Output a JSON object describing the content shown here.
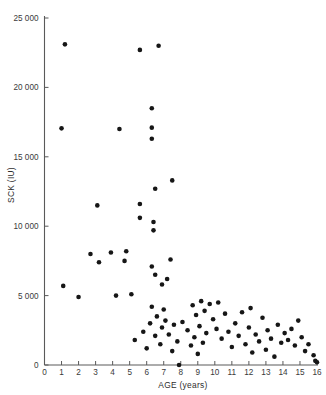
{
  "chart_data": {
    "type": "scatter",
    "title": "",
    "xlabel": "AGE (years)",
    "ylabel": "SCK (IU)",
    "xlim": [
      0,
      16
    ],
    "ylim": [
      0,
      25000
    ],
    "grid": false,
    "legend": null,
    "xticks": [
      0,
      1,
      2,
      3,
      4,
      5,
      6,
      7,
      8,
      9,
      10,
      11,
      12,
      13,
      14,
      15,
      16
    ],
    "xticklabels": [
      "0",
      "1",
      "2",
      "3",
      "4",
      "5",
      "6",
      "7",
      "8",
      "9",
      "10",
      "11",
      "12",
      "13",
      "14",
      "15",
      "16"
    ],
    "yticks": [
      0,
      5000,
      10000,
      15000,
      20000,
      25000
    ],
    "yticklabels": [
      "0",
      "5 000",
      "10 000",
      "15 000",
      "20 000",
      "25 000"
    ],
    "marker": "circle",
    "marker_color": "#161616",
    "marker_size": 2.3,
    "series": [
      {
        "name": "SCK vs Age",
        "points": [
          [
            1.2,
            23100
          ],
          [
            5.6,
            22700
          ],
          [
            6.7,
            23000
          ],
          [
            1.0,
            17050
          ],
          [
            4.4,
            17000
          ],
          [
            6.3,
            18500
          ],
          [
            6.3,
            17100
          ],
          [
            6.3,
            16300
          ],
          [
            3.1,
            11500
          ],
          [
            5.6,
            11600
          ],
          [
            6.5,
            12700
          ],
          [
            7.5,
            13300
          ],
          [
            5.6,
            10600
          ],
          [
            6.4,
            10300
          ],
          [
            6.4,
            9700
          ],
          [
            1.1,
            5700
          ],
          [
            2.7,
            8000
          ],
          [
            3.2,
            7400
          ],
          [
            3.9,
            8100
          ],
          [
            4.7,
            7500
          ],
          [
            4.8,
            8200
          ],
          [
            2.0,
            4900
          ],
          [
            4.2,
            5000
          ],
          [
            5.1,
            5100
          ],
          [
            6.3,
            7100
          ],
          [
            6.5,
            6500
          ],
          [
            6.9,
            5800
          ],
          [
            7.2,
            6200
          ],
          [
            7.4,
            7600
          ],
          [
            5.3,
            1800
          ],
          [
            5.8,
            2400
          ],
          [
            6.0,
            1200
          ],
          [
            6.2,
            3000
          ],
          [
            6.3,
            4200
          ],
          [
            6.5,
            2100
          ],
          [
            6.6,
            3500
          ],
          [
            6.8,
            1500
          ],
          [
            6.9,
            2700
          ],
          [
            7.0,
            4000
          ],
          [
            7.1,
            3200
          ],
          [
            7.3,
            2200
          ],
          [
            7.5,
            1000
          ],
          [
            7.6,
            2900
          ],
          [
            7.8,
            1700
          ],
          [
            7.9,
            0
          ],
          [
            8.1,
            3100
          ],
          [
            8.4,
            2500
          ],
          [
            8.6,
            1400
          ],
          [
            8.7,
            4300
          ],
          [
            8.8,
            2000
          ],
          [
            8.9,
            3600
          ],
          [
            9.0,
            800
          ],
          [
            9.1,
            2800
          ],
          [
            9.2,
            4600
          ],
          [
            9.3,
            1600
          ],
          [
            9.4,
            3900
          ],
          [
            9.5,
            2300
          ],
          [
            9.7,
            4400
          ],
          [
            9.9,
            3300
          ],
          [
            10.1,
            2600
          ],
          [
            10.2,
            4500
          ],
          [
            10.4,
            1900
          ],
          [
            10.6,
            3700
          ],
          [
            10.8,
            2400
          ],
          [
            11.0,
            1300
          ],
          [
            11.2,
            3000
          ],
          [
            11.4,
            2100
          ],
          [
            11.6,
            3800
          ],
          [
            11.8,
            1500
          ],
          [
            12.0,
            2700
          ],
          [
            12.1,
            4100
          ],
          [
            12.2,
            900
          ],
          [
            12.4,
            2200
          ],
          [
            12.6,
            1700
          ],
          [
            12.8,
            3400
          ],
          [
            13.0,
            1100
          ],
          [
            13.1,
            2500
          ],
          [
            13.3,
            1900
          ],
          [
            13.5,
            600
          ],
          [
            13.7,
            2900
          ],
          [
            13.9,
            1600
          ],
          [
            14.1,
            2300
          ],
          [
            14.3,
            1800
          ],
          [
            14.5,
            2600
          ],
          [
            14.7,
            1400
          ],
          [
            14.9,
            3200
          ],
          [
            15.1,
            2000
          ],
          [
            15.3,
            1000
          ],
          [
            15.5,
            1500
          ],
          [
            15.8,
            700
          ],
          [
            15.9,
            300
          ],
          [
            16.0,
            200
          ]
        ]
      }
    ]
  },
  "axes": {
    "x_axis_name": "age-axis",
    "y_axis_name": "sck-axis"
  }
}
